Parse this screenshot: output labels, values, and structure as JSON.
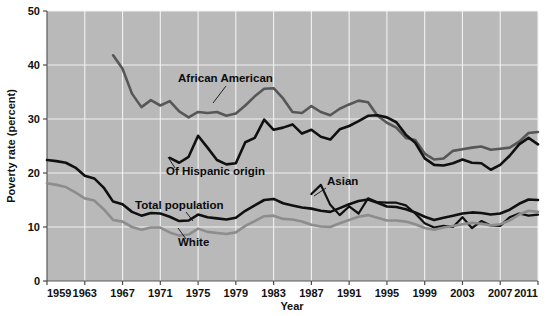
{
  "chart_data": {
    "type": "line",
    "title": "",
    "xlabel": "Year",
    "ylabel": "Poverty rate (percent)",
    "xlim": [
      1959,
      2011
    ],
    "ylim": [
      0,
      50
    ],
    "grid": true,
    "legend": "inline-labels",
    "plot_background": "#b9b9b9",
    "x_ticks": [
      1959,
      1963,
      1967,
      1971,
      1975,
      1979,
      1983,
      1987,
      1991,
      1995,
      1999,
      2003,
      2007,
      2011
    ],
    "y_ticks": [
      0,
      10,
      20,
      30,
      40,
      50
    ],
    "series": [
      {
        "name": "African American",
        "color": "#575757",
        "width": 2.6,
        "label": "African American",
        "label_x": 178,
        "label_y": 82,
        "leader": "M 226 86 L 213 103",
        "x": [
          1966,
          1967,
          1968,
          1969,
          1970,
          1971,
          1972,
          1973,
          1974,
          1975,
          1976,
          1977,
          1978,
          1979,
          1980,
          1981,
          1982,
          1983,
          1984,
          1985,
          1986,
          1987,
          1988,
          1989,
          1990,
          1991,
          1992,
          1993,
          1994,
          1995,
          1996,
          1997,
          1998,
          1999,
          2000,
          2001,
          2002,
          2003,
          2004,
          2005,
          2006,
          2007,
          2008,
          2009,
          2010,
          2011
        ],
        "values": [
          41.8,
          39.3,
          34.7,
          32.2,
          33.5,
          32.5,
          33.3,
          31.4,
          30.3,
          31.3,
          31.1,
          31.3,
          30.6,
          31.0,
          32.5,
          34.2,
          35.6,
          35.7,
          33.8,
          31.3,
          31.1,
          32.4,
          31.3,
          30.7,
          31.9,
          32.7,
          33.4,
          33.1,
          30.6,
          29.3,
          28.4,
          26.5,
          26.1,
          23.6,
          22.5,
          22.7,
          24.1,
          24.4,
          24.7,
          24.9,
          24.3,
          24.5,
          24.7,
          25.8,
          27.4,
          27.6
        ]
      },
      {
        "name": "Of Hispanic origin",
        "color": "#101010",
        "width": 2.6,
        "label": "Of Hispanic origin",
        "label_x": 166,
        "label_y": 175,
        "leader": "M 175 168 L 168 157",
        "x": [
          1972,
          1973,
          1974,
          1975,
          1976,
          1977,
          1978,
          1979,
          1980,
          1981,
          1982,
          1983,
          1984,
          1985,
          1986,
          1987,
          1988,
          1989,
          1990,
          1991,
          1992,
          1993,
          1994,
          1995,
          1996,
          1997,
          1998,
          1999,
          2000,
          2001,
          2002,
          2003,
          2004,
          2005,
          2006,
          2007,
          2008,
          2009,
          2010,
          2011
        ],
        "values": [
          22.8,
          21.9,
          23.0,
          26.9,
          24.7,
          22.4,
          21.6,
          21.8,
          25.7,
          26.5,
          29.9,
          28.0,
          28.4,
          29.0,
          27.3,
          28.0,
          26.7,
          26.2,
          28.1,
          28.7,
          29.6,
          30.6,
          30.7,
          30.3,
          29.4,
          27.1,
          25.6,
          22.7,
          21.5,
          21.4,
          21.8,
          22.5,
          21.9,
          21.8,
          20.6,
          21.5,
          23.2,
          25.3,
          26.5,
          25.3
        ]
      },
      {
        "name": "Asian",
        "color": "#101010",
        "width": 2.2,
        "label": "Asian",
        "label_x": 327,
        "label_y": 185,
        "leader": "M 326 188 L 314 196",
        "x": [
          1987,
          1988,
          1989,
          1990,
          1991,
          1992,
          1993,
          1994,
          1995,
          1996,
          1997,
          1998,
          1999,
          2000,
          2001,
          2002,
          2003,
          2004,
          2005,
          2006,
          2007,
          2008,
          2009,
          2010,
          2011
        ],
        "values": [
          16.1,
          17.8,
          14.1,
          12.2,
          13.8,
          12.5,
          15.3,
          14.6,
          14.5,
          14.5,
          14.0,
          12.5,
          10.7,
          9.9,
          10.2,
          10.0,
          11.8,
          9.8,
          11.1,
          10.3,
          10.2,
          11.8,
          12.5,
          12.1,
          12.3
        ]
      },
      {
        "name": "Total population",
        "color": "#101010",
        "width": 2.6,
        "label": "Total population",
        "label_x": 135,
        "label_y": 209,
        "leader": "M 186 212 L 193 221",
        "x": [
          1959,
          1960,
          1961,
          1962,
          1963,
          1964,
          1965,
          1966,
          1967,
          1968,
          1969,
          1970,
          1971,
          1972,
          1973,
          1974,
          1975,
          1976,
          1977,
          1978,
          1979,
          1980,
          1981,
          1982,
          1983,
          1984,
          1985,
          1986,
          1987,
          1988,
          1989,
          1990,
          1991,
          1992,
          1993,
          1994,
          1995,
          1996,
          1997,
          1998,
          1999,
          2000,
          2001,
          2002,
          2003,
          2004,
          2005,
          2006,
          2007,
          2008,
          2009,
          2010,
          2011
        ],
        "values": [
          22.4,
          22.2,
          21.9,
          21.0,
          19.5,
          19.0,
          17.3,
          14.7,
          14.2,
          12.8,
          12.1,
          12.6,
          12.5,
          11.9,
          11.1,
          11.2,
          12.3,
          11.8,
          11.6,
          11.4,
          11.7,
          13.0,
          14.0,
          15.0,
          15.2,
          14.4,
          14.0,
          13.6,
          13.4,
          13.0,
          12.8,
          13.5,
          14.2,
          14.8,
          15.1,
          14.5,
          13.8,
          13.7,
          13.3,
          12.7,
          11.9,
          11.3,
          11.7,
          12.1,
          12.5,
          12.7,
          12.6,
          12.3,
          12.5,
          13.2,
          14.3,
          15.1,
          15.0
        ]
      },
      {
        "name": "White",
        "color": "#8d8d8d",
        "width": 2.6,
        "label": "White",
        "label_x": 178,
        "label_y": 246,
        "leader": "M 186 239 L 178 228",
        "x": [
          1959,
          1960,
          1961,
          1962,
          1963,
          1964,
          1965,
          1966,
          1967,
          1968,
          1969,
          1970,
          1971,
          1972,
          1973,
          1974,
          1975,
          1976,
          1977,
          1978,
          1979,
          1980,
          1981,
          1982,
          1983,
          1984,
          1985,
          1986,
          1987,
          1988,
          1989,
          1990,
          1991,
          1992,
          1993,
          1994,
          1995,
          1996,
          1997,
          1998,
          1999,
          2000,
          2001,
          2002,
          2003,
          2004,
          2005,
          2006,
          2007,
          2008,
          2009,
          2010,
          2011
        ],
        "values": [
          18.1,
          17.8,
          17.4,
          16.4,
          15.3,
          14.9,
          13.3,
          11.3,
          11.0,
          10.0,
          9.5,
          9.9,
          9.9,
          9.0,
          8.4,
          8.6,
          9.7,
          9.1,
          8.9,
          8.7,
          9.0,
          10.2,
          11.1,
          12.0,
          12.1,
          11.5,
          11.4,
          11.0,
          10.4,
          10.1,
          10.0,
          10.7,
          11.3,
          11.9,
          12.2,
          11.7,
          11.2,
          11.2,
          11.0,
          10.5,
          9.8,
          9.5,
          9.9,
          10.2,
          10.5,
          10.8,
          10.6,
          10.3,
          10.5,
          11.2,
          12.3,
          13.0,
          12.8
        ]
      }
    ]
  },
  "axes": {
    "y_title": "Poverty rate (percent)",
    "x_title": "Year"
  }
}
